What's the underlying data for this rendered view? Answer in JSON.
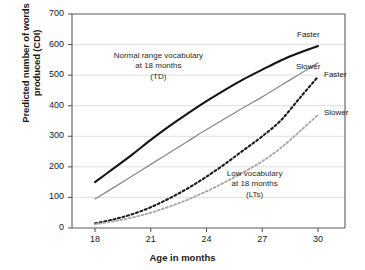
{
  "chart_data": {
    "type": "line",
    "title": "",
    "xlabel": "Age in months",
    "ylabel": "Predicted number of words produced (CDI)",
    "ylabel_line1": "Predicted number of words",
    "ylabel_line2": "produced (CDI)",
    "xlim": [
      18,
      30
    ],
    "ylim": [
      0,
      700
    ],
    "xticks": [
      18,
      21,
      24,
      27,
      30
    ],
    "yticks": [
      0,
      100,
      200,
      300,
      400,
      500,
      600,
      700
    ],
    "grid": true,
    "legend_position": "right-edge-inline",
    "x": [
      18,
      19,
      20,
      21,
      22,
      23,
      24,
      25,
      26,
      27,
      28,
      29,
      30
    ],
    "series": [
      {
        "name": "TD Faster",
        "group": "Normal range vocabulary at 18 months (TD)",
        "rate": "Faster",
        "style": "solid",
        "color": "#141414",
        "width": 2.1,
        "values": [
          150,
          195,
          240,
          288,
          333,
          375,
          415,
          452,
          487,
          518,
          548,
          573,
          595
        ]
      },
      {
        "name": "TD Slower",
        "group": "Normal range vocabulary at 18 months (TD)",
        "rate": "Slower",
        "style": "solid",
        "color": "#8a8a8a",
        "width": 1.3,
        "values": [
          95,
          132,
          170,
          208,
          246,
          284,
          322,
          358,
          394,
          429,
          466,
          503,
          540
        ]
      },
      {
        "name": "LT Faster",
        "group": "Low vocabulary at 18 months (LTs)",
        "rate": "Faster",
        "style": "dotted",
        "color": "#1c1c1c",
        "width": 2.1,
        "values": [
          15,
          28,
          45,
          68,
          97,
          130,
          168,
          210,
          255,
          300,
          352,
          424,
          495
        ]
      },
      {
        "name": "LT Slower",
        "group": "Low vocabulary at 18 months (LTs)",
        "rate": "Slower",
        "style": "dotted",
        "color": "#a9a9a9",
        "width": 1.9,
        "values": [
          12,
          22,
          34,
          50,
          70,
          93,
          120,
          150,
          183,
          218,
          262,
          315,
          370
        ]
      }
    ],
    "annotations": [
      {
        "id": "td-annotation",
        "line1": "Normal range vocabulary",
        "line2": "at 18 months",
        "line3": "(TD)",
        "at_x": 21.4,
        "at_y": 560
      },
      {
        "id": "lt-annotation",
        "line1": "Low vocabulary",
        "line2": "at 18 months",
        "line3": "(LTs)",
        "at_x": 26.6,
        "at_y": 175
      }
    ],
    "edge_labels": [
      {
        "id": "td-faster-label",
        "text": "Faster",
        "series": "TD Faster"
      },
      {
        "id": "td-slower-label",
        "text": "Slower",
        "series": "TD Slower"
      },
      {
        "id": "lt-faster-label",
        "text": "Faster",
        "series": "LT Faster"
      },
      {
        "id": "lt-slower-label",
        "text": "Slower",
        "series": "LT Slower"
      }
    ],
    "colors": {
      "axis": "#5a5a5a",
      "grid": "#d7d7d7",
      "text": "#1a1a1a",
      "background": "#ffffff"
    }
  }
}
